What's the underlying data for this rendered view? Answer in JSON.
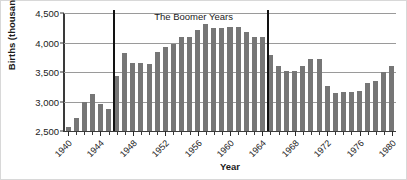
{
  "chart_data": {
    "type": "bar",
    "title": "",
    "xlabel": "Year",
    "ylabel": "Births (thousands)",
    "ylim": [
      2500,
      4500
    ],
    "yticks": [
      "2,500",
      "3,000",
      "3,500",
      "4,000",
      "4,500"
    ],
    "ytick_values": [
      2500,
      3000,
      3500,
      4000,
      4500
    ],
    "grid": true,
    "legend": "none",
    "categories": [
      "1940",
      "1941",
      "1942",
      "1943",
      "1944",
      "1945",
      "1946",
      "1947",
      "1948",
      "1949",
      "1950",
      "1951",
      "1952",
      "1953",
      "1954",
      "1955",
      "1956",
      "1957",
      "1958",
      "1959",
      "1960",
      "1961",
      "1962",
      "1963",
      "1964",
      "1965",
      "1966",
      "1967",
      "1968",
      "1969",
      "1970",
      "1971",
      "1972",
      "1973",
      "1974",
      "1975",
      "1976",
      "1977",
      "1978",
      "1979",
      "1980"
    ],
    "values": [
      2570,
      2725,
      2990,
      3120,
      2960,
      2865,
      3425,
      3820,
      3650,
      3660,
      3640,
      3840,
      3930,
      3970,
      4090,
      4100,
      4220,
      4310,
      4250,
      4250,
      4260,
      4260,
      4170,
      4100,
      4090,
      3780,
      3610,
      3525,
      3520,
      3610,
      3725,
      3725,
      3260,
      3150,
      3165,
      3160,
      3180,
      3320,
      3340,
      3500,
      3610
    ],
    "xtick_labels": [
      "1940",
      "1944",
      "1948",
      "1952",
      "1956",
      "1960",
      "1964",
      "1968",
      "1972",
      "1976",
      "1980"
    ],
    "xtick_years": [
      1940,
      1944,
      1948,
      1952,
      1956,
      1960,
      1964,
      1968,
      1972,
      1976,
      1980
    ],
    "annotations": [
      {
        "text": "The Boomer Years",
        "year_center": 1955.5
      }
    ],
    "era_markers": [
      {
        "name": "boomer-start",
        "year": 1945.6
      },
      {
        "name": "boomer-end",
        "year": 1964.6
      }
    ],
    "colors": {
      "bar": "#767676",
      "gridline": "#9a9a9a",
      "axis": "#3a3a3a",
      "marker": "#121212",
      "text": "#1b1b1b",
      "background": "#ffffff",
      "border": "#d8d8d8"
    }
  }
}
